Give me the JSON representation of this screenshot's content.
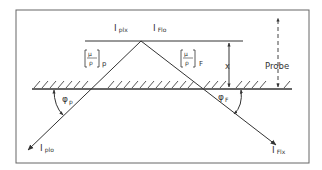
{
  "diagram": {
    "labels": {
      "i_p_lx": {
        "main": "I",
        "sub": "plx"
      },
      "i_f_lo": {
        "main": "I",
        "sub": "Flo"
      },
      "i_p_lo": {
        "main": "I",
        "sub": "plo"
      },
      "i_f_lx": {
        "main": "I",
        "sub": "Flx"
      },
      "mu_rho_p": {
        "num": "μ",
        "den": "ρ",
        "sub": "p"
      },
      "mu_rho_f": {
        "num": "μ",
        "den": "ρ",
        "sub": "F"
      },
      "phi_p": {
        "main": "φ",
        "sub": "p"
      },
      "phi_f": {
        "main": "φ",
        "sub": "F"
      },
      "x": "x",
      "probe": "Probe"
    },
    "colors": {
      "line": "#333333",
      "frame": "#555555",
      "background": "#ffffff"
    }
  }
}
